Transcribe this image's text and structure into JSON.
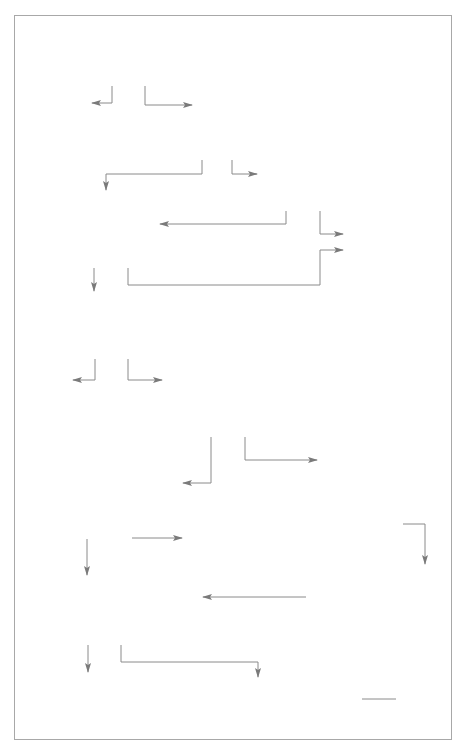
{
  "diagram": {
    "nodes": {
      "q1": {
        "num": "1",
        "text": "Does the core idea of the brand support the business concept?",
        "options": [
          "No",
          "Yes"
        ]
      },
      "q2": {
        "num": "2",
        "text": "Are the target customers already customers of the group?",
        "options": [
          "Yes",
          "No"
        ]
      },
      "q2_1": {
        "num": "2.1",
        "text": "Are the target customers aware of the brand?",
        "options": [
          "Yes",
          "No"
        ]
      },
      "q3": {
        "num": "3",
        "text": "Would the brand positively influence their perception and interest in the intended product/service?",
        "options": [
          "Yes",
          "No"
        ]
      },
      "q4": {
        "num": "4",
        "text_pre": "Are ",
        "text_em": "all",
        "text_post": " the brand values supported by the proposed product/service?",
        "options": [
          "No",
          "Yes"
        ]
      },
      "q4_1": {
        "num": "4.1",
        "text_pre": "Does product/service have any ",
        "text_em": "attributes",
        "text_post": " which would undermine any of the brand values (thereby endangering the integrity of the brand)",
        "options": [
          "No",
          "Yes"
        ]
      },
      "q5": {
        "num": "5",
        "text": "Does the business concept deliver new customer benefits. (that is, benefits which are not already delivered by an existing group branded product (or product line)?",
        "options": [
          "Yes",
          "No"
        ]
      },
      "q5_1": {
        "num": "5.1",
        "text": "Which existing branded product line best supports the product for understanding by customers?"
      },
      "q5_2": {
        "num": "5.2",
        "text": "Develop a product name to be delivered by the best existing branded product line"
      },
      "q6": {
        "num": "6",
        "text": "Does the proposed name (product title) suggest that the product/service attributes are 'on-brand' with the values?",
        "options": [
          "No",
          "Yes"
        ]
      }
    },
    "rejects": {
      "a": {
        "title": "A. Reject",
        "text": "Reject outright or redevelop the business concept to create a type of product/service which is suitable to be delivered by the brand"
      },
      "b": {
        "title": "B. Reject",
        "text": "The brand (or endorsement) will not support the success of the proposed activity. The business concept may be better delivered by an alternative (or new) brand"
      },
      "c": {
        "title": "C. Reject",
        "text": "Redevelop the product/service attributes and/or format to deliver on all brand values"
      },
      "d": {
        "title": "D. Reject",
        "text": "Reject outright or redevelop the business to create product/service attributes which are on-brand – and if possible enhance the brand"
      },
      "e": {
        "title": "E. Reject",
        "text": "Develop a product name which describes the product attributes as delivering 'on-brand' values"
      }
    },
    "brand_list": [
      {
        "key": "a.",
        "label": "Main brand"
      },
      {
        "key": "b.",
        "label": "Divisional brand i"
      },
      {
        "key": "c.",
        "label": "Divisional brand ii"
      },
      {
        "key": "d.",
        "label": "Product brand i"
      }
    ],
    "outcome": {
      "text": "The proposed product/ service is 'on-brand'"
    },
    "next_step": {
      "text": "Go to 7 on Part 2 of the tree"
    },
    "colors": {
      "decision_box": "#9a9a9a",
      "line": "#8a8a8a",
      "frame": "#a8a8a8",
      "text": "#4f4f4f"
    }
  }
}
